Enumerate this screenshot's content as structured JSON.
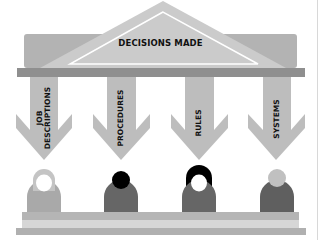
{
  "diagram": {
    "title": "DECISIONS MADE",
    "pillars": [
      {
        "label_line1": "JOB",
        "label_line2": "DESCRIPTIONS"
      },
      {
        "label_line1": "PROCEDURES",
        "label_line2": ""
      },
      {
        "label_line1": "RULES",
        "label_line2": ""
      },
      {
        "label_line1": "SYSTEMS",
        "label_line2": ""
      }
    ],
    "people": [
      {
        "name": "person-1",
        "style": "outline-hair"
      },
      {
        "name": "person-2",
        "style": "dark-round-head"
      },
      {
        "name": "person-3",
        "style": "dark-long-hair"
      },
      {
        "name": "person-4",
        "style": "light-round-head"
      }
    ],
    "colors": {
      "roof": "#c9c9c9",
      "back_block": "#b3b3b3",
      "beam": "#8f8f8f",
      "pillar": "#bdbdbd",
      "person_light": "#a9a9a9",
      "person_dark": "#666666",
      "hair_dark": "#000000",
      "base_top": "#b5b5b5",
      "base_mid": "#d4d4d4",
      "base_bottom": "#b0b0b0"
    }
  }
}
